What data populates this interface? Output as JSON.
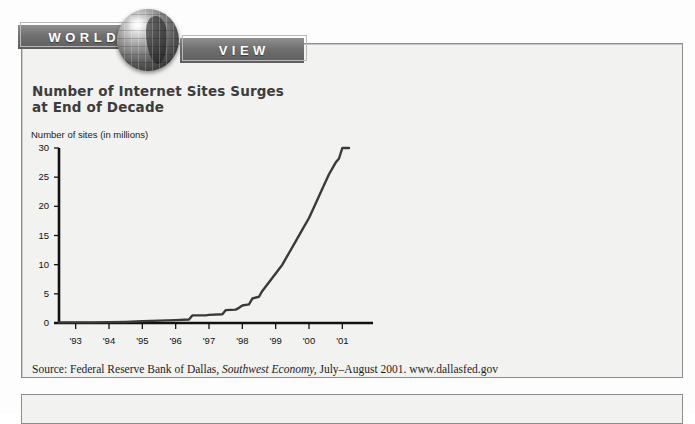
{
  "banner": {
    "word_left": "WORLD",
    "word_right": "VIEW",
    "globe_icon": "globe-icon"
  },
  "article": {
    "headline": "Number of Internet Sites Surges\nat End of Decade",
    "source_prefix": "Source: Federal Reserve Bank of Dallas,",
    "source_publication": "Southwest Economy,",
    "source_suffix": "July–August 2001. www.dallasfed.gov"
  },
  "colors": {
    "banner_bar": "#6f6f6f",
    "paper": "#f2f2f0",
    "line": "#3a3a3a",
    "axis": "#111111",
    "border": "#8d8d8f"
  },
  "chart_data": {
    "type": "line",
    "title": "Number of Internet Sites Surges at End of Decade",
    "xlabel": "",
    "ylabel": "Number of sites (in millions)",
    "ylim": [
      0,
      30
    ],
    "xlim": [
      1992.5,
      2001.5
    ],
    "yticks": [
      0,
      5,
      10,
      15,
      20,
      25,
      30
    ],
    "ytick_labels": [
      "0",
      "5",
      "10",
      "15",
      "20",
      "25",
      "30"
    ],
    "xticks": [
      1993,
      1994,
      1995,
      1996,
      1997,
      1998,
      1999,
      2000,
      2001
    ],
    "xtick_labels": [
      "'93",
      "'94",
      "'95",
      "'96",
      "'97",
      "'98",
      "'99",
      "'00",
      "'01"
    ],
    "grid": false,
    "legend": false,
    "series": [
      {
        "name": "Internet sites",
        "x": [
          1992.5,
          1993.0,
          1993.5,
          1994.0,
          1994.5,
          1995.0,
          1995.5,
          1996.0,
          1996.4,
          1996.5,
          1996.9,
          1997.0,
          1997.4,
          1997.5,
          1997.8,
          1997.9,
          1998.0,
          1998.2,
          1998.3,
          1998.5,
          1998.6,
          1998.8,
          1999.0,
          1999.2,
          1999.4,
          1999.6,
          1999.8,
          2000.0,
          2000.2,
          2000.4,
          2000.6,
          2000.8,
          2000.9,
          2001.0,
          2001.2
        ],
        "y": [
          0.1,
          0.1,
          0.1,
          0.15,
          0.2,
          0.3,
          0.4,
          0.5,
          0.6,
          1.3,
          1.3,
          1.4,
          1.5,
          2.2,
          2.3,
          2.6,
          3.0,
          3.2,
          4.2,
          4.5,
          5.5,
          7.0,
          8.5,
          10.0,
          12.0,
          14.0,
          16.0,
          18.0,
          20.5,
          23.0,
          25.5,
          27.5,
          28.2,
          30.0,
          30.0
        ]
      }
    ]
  }
}
